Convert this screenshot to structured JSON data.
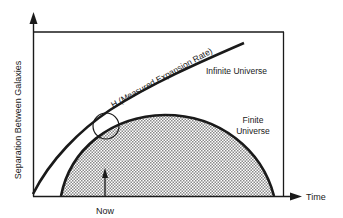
{
  "diagram": {
    "y_axis_label": "Separation Between Galaxies",
    "x_axis_label": "Time",
    "now_label": "Now",
    "hubble_label": "H (Measured Expansion Rate)",
    "infinite_label": "Infinite Universe",
    "finite_label_line1": "Finite",
    "finite_label_line2": "Universe"
  },
  "colors": {
    "ink": "#1a1a1a",
    "fill_shade": "#c8c8c8",
    "background": "#ffffff"
  }
}
